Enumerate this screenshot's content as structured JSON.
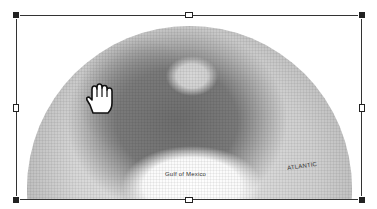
{
  "selected_object": {
    "type": "image",
    "description": "globe-north-america",
    "map_labels": {
      "gulf": "Gulf of Mexico",
      "ocean": "ATLANTIC"
    }
  },
  "selection_frame": {
    "handles": [
      "top-left",
      "top-center",
      "top-right",
      "middle-left",
      "middle-right",
      "bottom-left",
      "bottom-center",
      "bottom-right"
    ]
  },
  "cursor": {
    "type": "hand-grab-icon"
  },
  "colors": {
    "frame": "#333333",
    "handle_fill": "#222222",
    "background": "#ffffff"
  }
}
